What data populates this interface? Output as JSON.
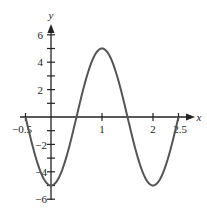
{
  "chart_data": {
    "type": "line",
    "title": "",
    "xlabel": "x",
    "ylabel": "y",
    "xlim": [
      -0.5,
      2.5
    ],
    "ylim": [
      -6,
      6
    ],
    "x_ticks": [
      -0.5,
      1,
      2,
      2.5
    ],
    "x_tick_labels": [
      "-0.5",
      "1",
      "2",
      "2.5"
    ],
    "y_ticks": [
      -6,
      -5,
      -4,
      -3,
      -2,
      -1,
      1,
      2,
      3,
      4,
      5,
      6
    ],
    "y_tick_labels": [
      "6",
      "4",
      "2",
      "-2",
      "-4",
      "-6"
    ],
    "grid": false,
    "function": "y = -5 cos(pi x)",
    "series": [
      {
        "name": "curve",
        "color": "#555555",
        "x": [
          -0.5,
          -0.25,
          0,
          0.25,
          0.5,
          0.75,
          1,
          1.25,
          1.5,
          1.75,
          2,
          2.25,
          2.5
        ],
        "y": [
          0,
          -3.54,
          -5,
          -3.54,
          0,
          3.54,
          5,
          3.54,
          0,
          -3.54,
          -5,
          -3.54,
          0
        ]
      }
    ]
  },
  "labels": {
    "x_axis": "x",
    "y_axis": "y",
    "y6": "6",
    "y4": "4",
    "y2": "2",
    "yn2": "−2",
    "yn4": "−4",
    "yn6": "−6",
    "xn05": "−0.5",
    "x1": "1",
    "x2": "2",
    "x25": "2.5"
  }
}
